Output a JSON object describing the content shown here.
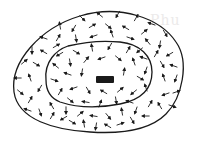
{
  "diagram": {
    "title": "",
    "ghost_text": "Phu",
    "colors": {
      "line": "#1a1a1a",
      "background": "#ffffff",
      "ghost": "#ecebeb"
    },
    "outer_boundary": "M14,92 C10,62 40,28 80,16 C120,4 160,18 176,42 C190,62 182,98 166,114 C150,130 120,134 90,132 C55,130 18,120 14,92 Z",
    "inner_boundary": "M46,80 C44,62 56,50 68,46 C84,42 100,40 120,42 C140,44 152,56 152,72 C152,90 140,100 120,104 C100,108 78,108 60,102 C50,98 46,90 46,80 Z",
    "center_bar": {
      "x": 96,
      "y": 76,
      "w": 18,
      "h": 7
    },
    "arrows": [
      [
        82,
        18,
        45
      ],
      [
        100,
        15,
        220
      ],
      [
        118,
        14,
        120
      ],
      [
        136,
        18,
        300
      ],
      [
        152,
        24,
        200
      ],
      [
        165,
        33,
        60
      ],
      [
        60,
        26,
        260
      ],
      [
        74,
        28,
        120
      ],
      [
        92,
        26,
        330
      ],
      [
        108,
        26,
        40
      ],
      [
        126,
        28,
        210
      ],
      [
        144,
        32,
        320
      ],
      [
        160,
        44,
        100
      ],
      [
        44,
        38,
        200
      ],
      [
        58,
        38,
        300
      ],
      [
        76,
        38,
        80
      ],
      [
        94,
        36,
        160
      ],
      [
        112,
        34,
        250
      ],
      [
        130,
        38,
        20
      ],
      [
        148,
        42,
        230
      ],
      [
        170,
        54,
        150
      ],
      [
        32,
        50,
        90
      ],
      [
        44,
        52,
        210
      ],
      [
        56,
        46,
        330
      ],
      [
        140,
        50,
        140
      ],
      [
        156,
        54,
        300
      ],
      [
        174,
        66,
        200
      ],
      [
        24,
        62,
        320
      ],
      [
        36,
        64,
        30
      ],
      [
        162,
        64,
        60
      ],
      [
        176,
        78,
        110
      ],
      [
        18,
        78,
        180
      ],
      [
        30,
        78,
        250
      ],
      [
        40,
        88,
        120
      ],
      [
        164,
        78,
        250
      ],
      [
        176,
        92,
        340
      ],
      [
        20,
        92,
        40
      ],
      [
        30,
        100,
        300
      ],
      [
        166,
        94,
        160
      ],
      [
        172,
        106,
        20
      ],
      [
        28,
        110,
        200
      ],
      [
        40,
        112,
        70
      ],
      [
        52,
        116,
        300
      ],
      [
        64,
        118,
        150
      ],
      [
        160,
        106,
        240
      ],
      [
        72,
        122,
        30
      ],
      [
        84,
        124,
        260
      ],
      [
        96,
        126,
        100
      ],
      [
        108,
        126,
        210
      ],
      [
        120,
        124,
        340
      ],
      [
        132,
        120,
        60
      ],
      [
        146,
        116,
        180
      ],
      [
        52,
        106,
        240
      ],
      [
        66,
        110,
        90
      ],
      [
        80,
        114,
        320
      ],
      [
        94,
        116,
        190
      ],
      [
        108,
        116,
        50
      ],
      [
        122,
        112,
        260
      ],
      [
        136,
        110,
        110
      ],
      [
        150,
        104,
        300
      ],
      [
        60,
        54,
        150
      ],
      [
        76,
        52,
        30
      ],
      [
        92,
        48,
        260
      ],
      [
        110,
        46,
        120
      ],
      [
        128,
        50,
        300
      ],
      [
        144,
        58,
        200
      ],
      [
        56,
        66,
        220
      ],
      [
        70,
        62,
        80
      ],
      [
        86,
        60,
        310
      ],
      [
        102,
        58,
        160
      ],
      [
        118,
        58,
        40
      ],
      [
        134,
        62,
        250
      ],
      [
        146,
        70,
        110
      ],
      [
        54,
        80,
        20
      ],
      [
        68,
        74,
        200
      ],
      [
        82,
        72,
        100
      ],
      [
        124,
        72,
        280
      ],
      [
        140,
        78,
        30
      ],
      [
        60,
        92,
        300
      ],
      [
        74,
        88,
        160
      ],
      [
        88,
        90,
        60
      ],
      [
        104,
        92,
        210
      ],
      [
        120,
        90,
        320
      ],
      [
        134,
        92,
        140
      ],
      [
        146,
        88,
        250
      ],
      [
        70,
        100,
        40
      ],
      [
        86,
        102,
        190
      ],
      [
        100,
        104,
        290
      ],
      [
        116,
        100,
        80
      ],
      [
        130,
        102,
        200
      ]
    ]
  }
}
